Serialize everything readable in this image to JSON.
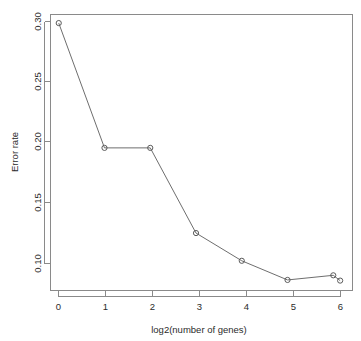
{
  "chart_data": {
    "type": "line",
    "title": "",
    "xlabel": "log2(number of genes)",
    "ylabel": "Error rate",
    "x": [
      0,
      1,
      2,
      3,
      4,
      5,
      6,
      6.15
    ],
    "values": [
      0.298,
      0.2035,
      0.2035,
      0.139,
      0.118,
      0.1035,
      0.107,
      0.103
    ],
    "series": [
      {
        "name": "Error rate",
        "x": [
          0,
          1,
          2,
          3,
          4,
          5,
          6,
          6.15
        ],
        "values": [
          0.298,
          0.2035,
          0.2035,
          0.139,
          0.118,
          0.1035,
          0.107,
          0.103
        ]
      }
    ],
    "xlim": [
      -0.18,
      6.42
    ],
    "ylim": [
      0.0955,
      0.3045
    ],
    "xticks": [
      0,
      1,
      2,
      3,
      4,
      5,
      6
    ],
    "xtick_labels": [
      "0",
      "1",
      "2",
      "3",
      "4",
      "5",
      "6"
    ],
    "yticks": [
      0.1,
      0.15,
      0.2,
      0.25,
      0.3
    ],
    "ytick_labels": [
      "0.10",
      "0.15",
      "0.20",
      "0.25",
      "0.30"
    ],
    "grid": false,
    "legend": null,
    "marker": "open-circle",
    "line_color": "#6e6e6e",
    "marker_color": "#5a5a5a",
    "axis_color": "#8a8a8a",
    "text_color": "#2b2b2b",
    "background": "#ffffff"
  }
}
